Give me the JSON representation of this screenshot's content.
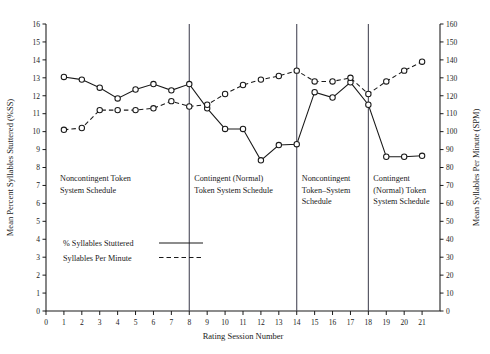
{
  "chart_data": {
    "type": "line",
    "title": "",
    "xlabel": "Rating Session Number",
    "ylabel": "Mean Percent Syllables Stuttered (%SS)",
    "y2label": "Mean Syllables Per Minute (SPM)",
    "x": [
      1,
      2,
      3,
      4,
      5,
      6,
      7,
      8,
      9,
      10,
      11,
      12,
      13,
      14,
      15,
      16,
      17,
      18,
      19,
      20,
      21
    ],
    "xlim": [
      0,
      22
    ],
    "ylim": [
      0,
      16
    ],
    "y2lim": [
      0,
      160
    ],
    "xticks": [
      0,
      1,
      2,
      3,
      4,
      5,
      6,
      7,
      8,
      9,
      10,
      11,
      12,
      13,
      14,
      15,
      16,
      17,
      18,
      19,
      20,
      21
    ],
    "yticks": [
      0,
      1,
      2,
      3,
      4,
      5,
      6,
      7,
      8,
      9,
      10,
      11,
      12,
      13,
      14,
      15,
      16
    ],
    "y2ticks": [
      0,
      10,
      20,
      30,
      40,
      50,
      60,
      70,
      80,
      90,
      100,
      110,
      120,
      130,
      140,
      150,
      160
    ],
    "grid": false,
    "legend_position": "lower-left-inside",
    "series": [
      {
        "name": "% Syllables Stuttered",
        "axis": "left",
        "style": "solid",
        "marker": "open-circle",
        "values": [
          13.05,
          12.9,
          12.45,
          11.85,
          12.35,
          12.65,
          12.3,
          12.65,
          11.3,
          10.15,
          10.15,
          8.4,
          9.25,
          9.3,
          12.2,
          11.9,
          12.75,
          11.5,
          8.6,
          8.6,
          8.65
        ]
      },
      {
        "name": "Syllables Per Minute",
        "axis": "right",
        "style": "dashed",
        "marker": "open-circle",
        "values": [
          101,
          102,
          112,
          112,
          112,
          113,
          117,
          114,
          115,
          121,
          126,
          129,
          131,
          134,
          128,
          128,
          130,
          121,
          128,
          134,
          139
        ]
      }
    ],
    "phase_separators": [
      8,
      14,
      18
    ],
    "phases": [
      {
        "lines": [
          "Noncontingent Token",
          "System Schedule"
        ],
        "start": 0,
        "end": 8
      },
      {
        "lines": [
          "Contingent (Normal)",
          "Token System Schedule"
        ],
        "start": 8,
        "end": 14
      },
      {
        "lines": [
          "Noncontingent",
          "Token–System",
          "Schedule"
        ],
        "start": 14,
        "end": 18
      },
      {
        "lines": [
          "Contingent",
          "(Normal) Token",
          "System Schedule"
        ],
        "start": 18,
        "end": 22
      }
    ]
  },
  "axes": {
    "x_title": "Rating Session Number",
    "y_left_title": "Mean Percent Syllables Stuttered (%SS)",
    "y_right_title": "Mean Syllables Per Minute (SPM)"
  },
  "legend": {
    "items": [
      {
        "label": "% Syllables Stuttered",
        "style": "solid"
      },
      {
        "label": "Syllables Per Minute",
        "style": "dashed"
      }
    ]
  },
  "caption": {
    "text": "Fig"
  },
  "colors": {
    "ink": "#1a1a1a",
    "separator": "#4a4a58",
    "background": "#ffffff"
  }
}
